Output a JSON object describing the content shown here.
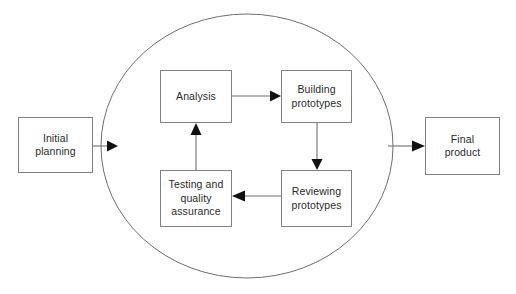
{
  "diagram": {
    "type": "flowchart-cycle",
    "background_color": "#ffffff",
    "box_border_color": "#808080",
    "line_color": "#6f6f6f",
    "arrowhead_color": "#111111",
    "text_color": "#2b2b2b",
    "cycle": {
      "name": "iteration-cycle",
      "shape": "circle",
      "center_x": 247,
      "center_y": 146,
      "radius": 146
    },
    "nodes": [
      {
        "id": "initial-planning",
        "label": "Initial\nplanning",
        "x": 18,
        "y": 117,
        "width": 75,
        "height": 56
      },
      {
        "id": "analysis",
        "label": "Analysis",
        "x": 160,
        "y": 70,
        "width": 72,
        "height": 53
      },
      {
        "id": "building-prototypes",
        "label": "Building\nprototypes",
        "x": 281,
        "y": 70,
        "width": 71,
        "height": 53
      },
      {
        "id": "reviewing-prototypes",
        "label": "Reviewing\nprototypes",
        "x": 281,
        "y": 170,
        "width": 71,
        "height": 57
      },
      {
        "id": "testing-and-quality-assurance",
        "label": "Testing and\nquality\nassurance",
        "x": 160,
        "y": 170,
        "width": 72,
        "height": 57
      },
      {
        "id": "final-product",
        "label": "Final\nproduct",
        "x": 425,
        "y": 117,
        "width": 75,
        "height": 58
      }
    ],
    "connectors": [
      {
        "id": "initial-planning-to-cycle",
        "from": "initial-planning",
        "to": "iteration-cycle",
        "direction": "right",
        "x1": 93,
        "y1": 146,
        "x2": 110,
        "y2": 146
      },
      {
        "id": "analysis-to-building-prototypes",
        "from": "analysis",
        "to": "building-prototypes",
        "direction": "right",
        "x1": 232,
        "y1": 96,
        "x2": 279,
        "y2": 96
      },
      {
        "id": "building-prototypes-to-reviewing-prototypes",
        "from": "building-prototypes",
        "to": "reviewing-prototypes",
        "direction": "down",
        "x1": 317,
        "y1": 123,
        "x2": 317,
        "y2": 168
      },
      {
        "id": "reviewing-prototypes-to-testing",
        "from": "reviewing-prototypes",
        "to": "testing-and-quality-assurance",
        "direction": "left",
        "x1": 281,
        "y1": 196,
        "x2": 234,
        "y2": 196
      },
      {
        "id": "testing-to-analysis",
        "from": "testing-and-quality-assurance",
        "to": "analysis",
        "direction": "up",
        "x1": 196,
        "y1": 170,
        "x2": 196,
        "y2": 125
      },
      {
        "id": "cycle-to-final-product",
        "from": "iteration-cycle",
        "to": "final-product",
        "direction": "right",
        "x1": 386,
        "y1": 146,
        "x2": 423,
        "y2": 146
      }
    ]
  }
}
